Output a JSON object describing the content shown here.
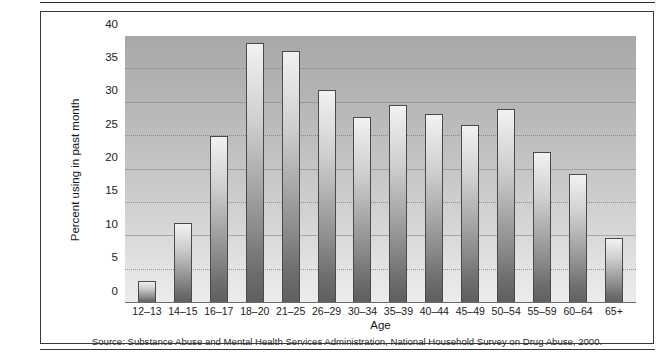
{
  "chart_data": {
    "type": "bar",
    "title": "",
    "xlabel": "Age",
    "ylabel": "Percent using in past month",
    "categories": [
      "12–13",
      "14–15",
      "16–17",
      "18–20",
      "21–25",
      "26–29",
      "30–34",
      "35–39",
      "40–44",
      "45–49",
      "50–54",
      "55–59",
      "60–64",
      "65+"
    ],
    "values": [
      3.3,
      12.0,
      25.0,
      39.0,
      37.7,
      31.9,
      27.9,
      29.7,
      28.3,
      26.6,
      29.1,
      22.6,
      19.3,
      9.7
    ],
    "ylim": [
      0,
      40
    ],
    "yticks": [
      0,
      5,
      10,
      15,
      20,
      25,
      30,
      35,
      40
    ],
    "ytick_labels": [
      "0",
      "5",
      "10",
      "15",
      "20",
      "25",
      "30",
      "35",
      "40"
    ],
    "grid": true,
    "legend": "none",
    "source_note": "Source: Substance Abuse and Mental Health Services Administration, National Household Survey on Drug Abuse, 2000.",
    "colors": {
      "bar_top": "#f2f2f2",
      "bar_bottom": "#5f5f5f",
      "bar_outline": "#4a4a4a",
      "plot_bg_top": "#a8a8a8",
      "plot_bg_bottom": "#ececec",
      "frame": "#3a3a3a",
      "text": "#1a1a1a"
    }
  }
}
